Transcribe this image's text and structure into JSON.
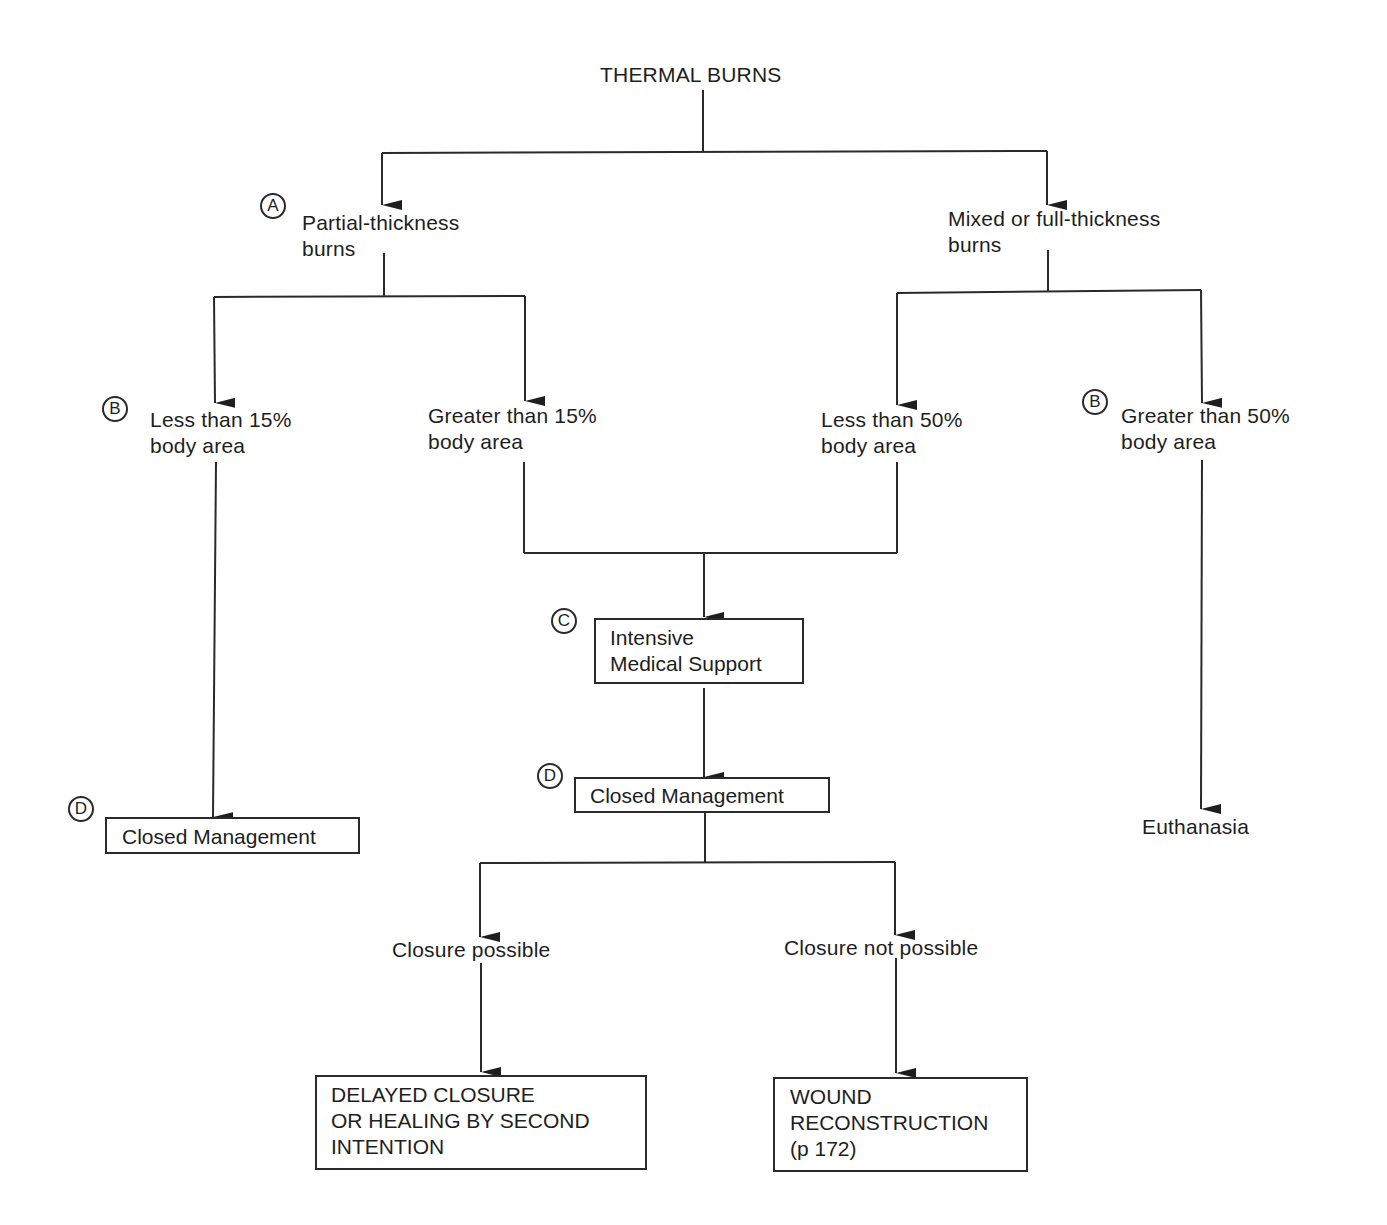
{
  "diagram": {
    "title": "THERMAL BURNS",
    "nodes": {
      "partial": {
        "badge": "A",
        "line1": "Partial-thickness",
        "line2": "burns"
      },
      "mixed": {
        "line1": "Mixed or full-thickness",
        "line2": "burns"
      },
      "less15": {
        "badge": "B",
        "line1": "Less than 15%",
        "line2": "body area"
      },
      "greater15": {
        "line1": "Greater than 15%",
        "line2": "body area"
      },
      "less50": {
        "line1": "Less than 50%",
        "line2": "body area"
      },
      "greater50": {
        "badge": "B",
        "line1": "Greater than 50%",
        "line2": "body area"
      },
      "intensive": {
        "badge": "C",
        "line1": "Intensive",
        "line2": "Medical Support"
      },
      "closed_center": {
        "badge": "D",
        "label": "Closed Management"
      },
      "closed_left": {
        "badge": "D",
        "label": "Closed Management"
      },
      "euthanasia": {
        "label": "Euthanasia"
      },
      "closure_possible": {
        "label": "Closure possible"
      },
      "closure_not_possible": {
        "label": "Closure not possible"
      },
      "delayed": {
        "line1": "DELAYED CLOSURE",
        "line2": "OR HEALING BY SECOND",
        "line3": "INTENTION"
      },
      "reconstruction": {
        "line1": "WOUND",
        "line2": "RECONSTRUCTION",
        "line3": "(p 172)"
      }
    },
    "colors": {
      "line": "#2a2a2a",
      "text": "#1e1e1e",
      "background": "#ffffff"
    }
  }
}
